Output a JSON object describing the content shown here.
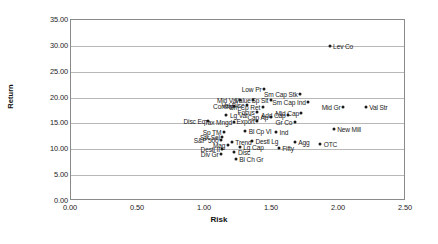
{
  "chart_data": {
    "type": "scatter",
    "title": "",
    "xlabel": "Risk",
    "ylabel": "Return",
    "xlim": [
      0.0,
      2.5
    ],
    "ylim": [
      0.0,
      35.0
    ],
    "xticks": [
      "0.00",
      "0.50",
      "1.00",
      "1.50",
      "2.00",
      "2.50"
    ],
    "yticks": [
      "0.00",
      "5.00",
      "10.00",
      "15.00",
      "20.00",
      "25.00",
      "30.00",
      "35.00"
    ],
    "grid": true,
    "legend": "none",
    "marker_color": "#1a1a1a",
    "points": [
      {
        "label": "Lev Co",
        "x": 1.93,
        "y": 29.9,
        "side": "right"
      },
      {
        "label": "Low Pr",
        "x": 1.44,
        "y": 21.6,
        "side": "left"
      },
      {
        "label": "Sm Cap Stk",
        "x": 1.71,
        "y": 20.7,
        "side": "left"
      },
      {
        "label": "Mid Val",
        "x": 1.26,
        "y": 19.6,
        "side": "left"
      },
      {
        "label": "Value",
        "x": 1.36,
        "y": 19.6,
        "side": "left"
      },
      {
        "label": "Sp Sit",
        "x": 1.49,
        "y": 19.6,
        "side": "left"
      },
      {
        "label": "Sm Cap Ind",
        "x": 1.77,
        "y": 19.2,
        "side": "left"
      },
      {
        "label": "Val Disc",
        "x": 1.31,
        "y": 18.5,
        "side": "left"
      },
      {
        "label": "Contra",
        "x": 1.22,
        "y": 18.3,
        "side": "left"
      },
      {
        "label": "Sm Cp Ret",
        "x": 1.43,
        "y": 18.1,
        "side": "left"
      },
      {
        "label": "Mid Gr",
        "x": 2.03,
        "y": 18.2,
        "side": "left"
      },
      {
        "label": "Val Str",
        "x": 2.2,
        "y": 18.1,
        "side": "right"
      },
      {
        "label": "Focus",
        "x": 1.39,
        "y": 17.2,
        "side": "left"
      },
      {
        "label": "Mid Cap",
        "x": 1.72,
        "y": 17.0,
        "side": "left"
      },
      {
        "label": "Lg Val",
        "x": 1.16,
        "y": 16.6,
        "side": "right"
      },
      {
        "label": "Add Cap",
        "x": 1.62,
        "y": 16.6,
        "side": "left"
      },
      {
        "label": "Cap Ap",
        "x": 1.49,
        "y": 16.2,
        "side": "left"
      },
      {
        "label": "Disc Eq",
        "x": 1.02,
        "y": 15.5,
        "side": "left"
      },
      {
        "label": "Tax Mngd",
        "x": 1.22,
        "y": 15.3,
        "side": "left"
      },
      {
        "label": "Export",
        "x": 1.39,
        "y": 15.4,
        "side": "left"
      },
      {
        "label": "Gr Co",
        "x": 1.67,
        "y": 15.2,
        "side": "left"
      },
      {
        "label": "New Mill",
        "x": 1.96,
        "y": 13.9,
        "side": "right"
      },
      {
        "label": "Bl Cp Vl",
        "x": 1.3,
        "y": 13.6,
        "side": "right"
      },
      {
        "label": "Ind",
        "x": 1.53,
        "y": 13.4,
        "side": "right"
      },
      {
        "label": "Sp TM",
        "x": 1.14,
        "y": 13.3,
        "side": "left"
      },
      {
        "label": "Stk Sel",
        "x": 1.13,
        "y": 12.4,
        "side": "left"
      },
      {
        "label": "S&P 500",
        "x": 1.12,
        "y": 11.8,
        "side": "left"
      },
      {
        "label": "Trend",
        "x": 1.2,
        "y": 11.4,
        "side": "right"
      },
      {
        "label": "Destl Lg",
        "x": 1.35,
        "y": 11.6,
        "side": "right"
      },
      {
        "label": "Agg",
        "x": 1.67,
        "y": 11.5,
        "side": "right"
      },
      {
        "label": "OTC",
        "x": 1.86,
        "y": 11.0,
        "side": "right"
      },
      {
        "label": "Mag",
        "x": 1.17,
        "y": 10.8,
        "side": "left"
      },
      {
        "label": "Lg Cap",
        "x": 1.26,
        "y": 10.4,
        "side": "right"
      },
      {
        "label": "Fifty",
        "x": 1.55,
        "y": 10.3,
        "side": "right"
      },
      {
        "label": "Destl II",
        "x": 1.13,
        "y": 10.1,
        "side": "left"
      },
      {
        "label": "Disc",
        "x": 1.22,
        "y": 9.5,
        "side": "right"
      },
      {
        "label": "Div Gr",
        "x": 1.12,
        "y": 9.0,
        "side": "left"
      },
      {
        "label": "Bl Ch Gr",
        "x": 1.23,
        "y": 8.2,
        "side": "right"
      }
    ]
  }
}
